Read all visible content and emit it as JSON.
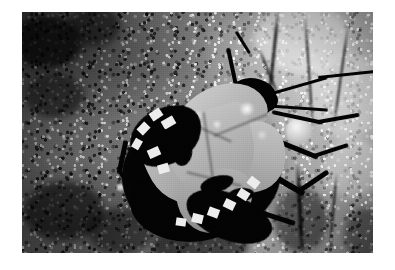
{
  "image": {
    "kind": "photograph",
    "medium": "black-and-white macro photograph",
    "subject": "shield bug (stink bug) on tree bark",
    "orientation": "landscape",
    "border": {
      "color": "#ffffff",
      "left_px": 22,
      "top_px": 12,
      "right_px": 22,
      "bottom_px": 17
    },
    "plate": {
      "width_px": 351,
      "height_px": 241
    },
    "palette": {
      "paper_white": "#ffffff",
      "bark_light": "#c9c9c9",
      "bark_mid": "#7d7d7d",
      "bark_dark": "#2a2a2a",
      "insect_black": "#0a0a0a",
      "insect_pale": "#b5b2a8",
      "stripe_white": "#e9e7e0",
      "specular_highlight": "#ffffff"
    }
  },
  "scene": {
    "background_label": "mottled tree bark substrate",
    "background_note": "coarse granular bark, darker and rougher at the left and lower-left, smoother and brighter toward the upper-right with vertical dark crack lines",
    "lighting": "hard directional light from upper right producing specular highlights on the insect's shell"
  },
  "subject": {
    "common_name": "shield bug",
    "body_label": "shield-shaped body",
    "pose": "head oriented toward the upper right, abdomen toward the lower left",
    "parts": [
      {
        "name": "pronotum",
        "tone": "pale grey"
      },
      {
        "name": "scutellum",
        "tone": "pale grey, triangular"
      },
      {
        "name": "left-corium",
        "tone": "pale grey"
      },
      {
        "name": "right-corium",
        "tone": "pale grey"
      },
      {
        "name": "membrane",
        "tone": "mid grey"
      },
      {
        "name": "abdomen",
        "tone": "black"
      },
      {
        "name": "connexivum",
        "tone": "black with white rectangular stripes"
      },
      {
        "name": "head",
        "tone": "black"
      },
      {
        "name": "antennae",
        "tone": "black, two, extending to the upper right"
      },
      {
        "name": "legs",
        "tone": "black, extending right and lower right"
      }
    ]
  }
}
